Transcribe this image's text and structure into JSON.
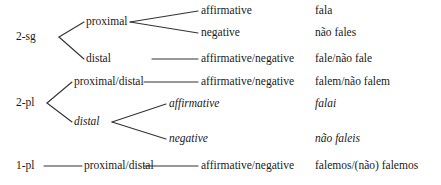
{
  "diagram": {
    "type": "tree",
    "columns": [
      "person-number",
      "deixis",
      "polarity",
      "verb-form"
    ],
    "line_color": "#333333",
    "text_color": "#1a1a1a",
    "background": "#ffffff",
    "nodes": {
      "root_2sg": "2-sg",
      "root_2pl": "2-pl",
      "root_1pl": "1-pl",
      "deixis_2sg_proximal": "proximal",
      "deixis_2sg_distal": "distal",
      "deixis_2pl_proxdist": "proximal/distal",
      "deixis_2pl_distal": "distal",
      "deixis_1pl_proxdist": "proximal/distal",
      "pol_2sg_prox_aff": "affirmative",
      "pol_2sg_prox_neg": "negative",
      "pol_2sg_distal": "affirmative/negative",
      "pol_2pl_proxdist": "affirmative/negative",
      "pol_2pl_distal_aff": "affirmative",
      "pol_2pl_distal_neg": "negative",
      "pol_1pl_proxdist": "affirmative/negative",
      "form_fala": "fala",
      "form_nao_fales": "não fales",
      "form_fale_nao_fale": "fale/não fale",
      "form_falem_nao_falem": "falem/não falem",
      "form_falai": "falai",
      "form_nao_faleis": "não faleis",
      "form_falemos": "falemos/(não) falemos"
    },
    "rows": [
      {
        "person": "2-sg",
        "deixis": "proximal",
        "polarity": "affirmative",
        "form": "fala",
        "italic": false
      },
      {
        "person": "2-sg",
        "deixis": "proximal",
        "polarity": "negative",
        "form": "não fales",
        "italic": false
      },
      {
        "person": "2-sg",
        "deixis": "distal",
        "polarity": "affirmative/negative",
        "form": "fale/não fale",
        "italic": false
      },
      {
        "person": "2-pl",
        "deixis": "proximal/distal",
        "polarity": "affirmative/negative",
        "form": "falem/não falem",
        "italic": false
      },
      {
        "person": "2-pl",
        "deixis": "distal",
        "polarity": "affirmative",
        "form": "falai",
        "italic": true
      },
      {
        "person": "2-pl",
        "deixis": "distal",
        "polarity": "negative",
        "form": "não faleis",
        "italic": true
      },
      {
        "person": "1-pl",
        "deixis": "proximal/distal",
        "polarity": "affirmative/negative",
        "form": "falemos/(não) falemos",
        "italic": false
      }
    ]
  }
}
